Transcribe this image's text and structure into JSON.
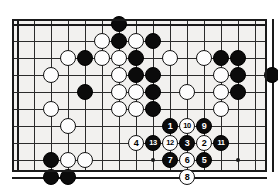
{
  "diagram": {
    "type": "go-board-problem",
    "board": {
      "cols": 16,
      "rows": 10,
      "cell": 17,
      "origin_x": 5,
      "origin_y": 5,
      "star_points": [
        [
          8,
          8
        ],
        [
          13,
          3
        ],
        [
          13,
          8
        ]
      ]
    },
    "stones": [
      {
        "c": "b",
        "x": 6,
        "y": 0
      },
      {
        "c": "w",
        "x": 5,
        "y": 1
      },
      {
        "c": "b",
        "x": 6,
        "y": 1
      },
      {
        "c": "w",
        "x": 7,
        "y": 1
      },
      {
        "c": "b",
        "x": 8,
        "y": 1
      },
      {
        "c": "w",
        "x": 3,
        "y": 2
      },
      {
        "c": "b",
        "x": 4,
        "y": 2
      },
      {
        "c": "w",
        "x": 5,
        "y": 2
      },
      {
        "c": "w",
        "x": 6,
        "y": 2
      },
      {
        "c": "b",
        "x": 7,
        "y": 2
      },
      {
        "c": "w",
        "x": 9,
        "y": 2
      },
      {
        "c": "w",
        "x": 11,
        "y": 2
      },
      {
        "c": "b",
        "x": 12,
        "y": 2
      },
      {
        "c": "b",
        "x": 13,
        "y": 2
      },
      {
        "c": "w",
        "x": 2,
        "y": 3
      },
      {
        "c": "w",
        "x": 6,
        "y": 3
      },
      {
        "c": "b",
        "x": 7,
        "y": 3
      },
      {
        "c": "b",
        "x": 8,
        "y": 3
      },
      {
        "c": "w",
        "x": 12,
        "y": 3
      },
      {
        "c": "b",
        "x": 13,
        "y": 3
      },
      {
        "c": "b",
        "x": 15,
        "y": 3
      },
      {
        "c": "b",
        "x": 4,
        "y": 4
      },
      {
        "c": "w",
        "x": 6,
        "y": 4
      },
      {
        "c": "w",
        "x": 7,
        "y": 4
      },
      {
        "c": "b",
        "x": 8,
        "y": 4
      },
      {
        "c": "w",
        "x": 10,
        "y": 4
      },
      {
        "c": "w",
        "x": 12,
        "y": 4
      },
      {
        "c": "b",
        "x": 13,
        "y": 4
      },
      {
        "c": "w",
        "x": 2,
        "y": 5
      },
      {
        "c": "w",
        "x": 6,
        "y": 5
      },
      {
        "c": "w",
        "x": 7,
        "y": 5
      },
      {
        "c": "b",
        "x": 8,
        "y": 5
      },
      {
        "c": "w",
        "x": 12,
        "y": 5
      },
      {
        "c": "w",
        "x": 3,
        "y": 6
      },
      {
        "c": "b",
        "x": 2,
        "y": 8
      },
      {
        "c": "w",
        "x": 3,
        "y": 8
      },
      {
        "c": "w",
        "x": 4,
        "y": 8
      },
      {
        "c": "b",
        "x": 2,
        "y": 9
      },
      {
        "c": "b",
        "x": 3,
        "y": 9
      }
    ],
    "moves": [
      {
        "n": 1,
        "c": "b",
        "x": 9,
        "y": 6
      },
      {
        "n": 2,
        "c": "w",
        "x": 11,
        "y": 7
      },
      {
        "n": 3,
        "c": "b",
        "x": 10,
        "y": 7
      },
      {
        "n": 4,
        "c": "w",
        "x": 7,
        "y": 7
      },
      {
        "n": 5,
        "c": "b",
        "x": 11,
        "y": 8
      },
      {
        "n": 6,
        "c": "w",
        "x": 10,
        "y": 8
      },
      {
        "n": 7,
        "c": "b",
        "x": 9,
        "y": 8
      },
      {
        "n": 8,
        "c": "w",
        "x": 10,
        "y": 9
      },
      {
        "n": 9,
        "c": "b",
        "x": 11,
        "y": 6
      },
      {
        "n": 10,
        "c": "w",
        "x": 10,
        "y": 6
      },
      {
        "n": 11,
        "c": "b",
        "x": 12,
        "y": 7
      },
      {
        "n": 12,
        "c": "w",
        "x": 9,
        "y": 7
      },
      {
        "n": 13,
        "c": "b",
        "x": 8,
        "y": 7
      }
    ]
  }
}
